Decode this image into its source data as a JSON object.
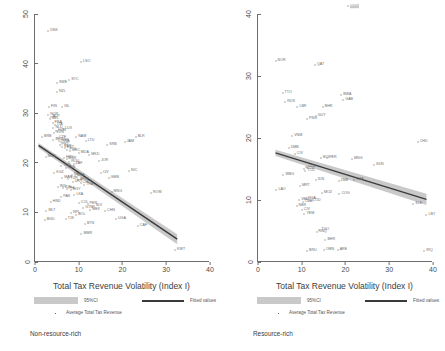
{
  "figure": {
    "type": "two-panel-scatter",
    "panels": [
      "non-resource-rich",
      "resource-rich"
    ]
  },
  "legend": {
    "ci_label": "95%CI",
    "fitted_label": "Fitted values",
    "average_label": "Average Total Tax Revenue",
    "ci_color": "#c9c9c9",
    "line_color": "#3a3a3a",
    "marker_color": "#6a6a6a"
  },
  "chart_data": [
    {
      "type": "scatter",
      "panel_id": "non-resource-rich",
      "title": "",
      "caption": "Non-resource-rich",
      "xlabel": "Total Tax Revenue Volatility (Index I)",
      "ylabel": "",
      "xlim": [
        0,
        40
      ],
      "ylim": [
        0,
        50
      ],
      "xticks": [
        0,
        10,
        20,
        30,
        40
      ],
      "yticks": [
        0,
        10,
        20,
        30,
        40,
        50
      ],
      "grid": false,
      "legend_position": "below-axis",
      "fit_line": {
        "x": [
          0.8,
          32.5
        ],
        "y": [
          23.5,
          4.6
        ],
        "ci_halfwidth": [
          0.5,
          1.0
        ]
      },
      "points": [
        {
          "label": "DNK",
          "x": 3.0,
          "y": 46.5
        },
        {
          "label": "LSO",
          "x": 10.5,
          "y": 40.4
        },
        {
          "label": "SWE",
          "x": 5.0,
          "y": 36.0
        },
        {
          "label": "SYC",
          "x": 7.8,
          "y": 36.6
        },
        {
          "label": "NZL",
          "x": 5.0,
          "y": 34.2
        },
        {
          "label": "FIN",
          "x": 3.2,
          "y": 31.2
        },
        {
          "label": "ISL",
          "x": 6.2,
          "y": 31.2
        },
        {
          "label": "NOR",
          "x": 3.0,
          "y": 29.6
        },
        {
          "label": "AUT",
          "x": 3.6,
          "y": 29.2
        },
        {
          "label": "BEL",
          "x": 3.4,
          "y": 28.8
        },
        {
          "label": "FRA",
          "x": 4.0,
          "y": 28.0
        },
        {
          "label": "ITA",
          "x": 4.6,
          "y": 27.6
        },
        {
          "label": "NLD",
          "x": 4.2,
          "y": 27.0
        },
        {
          "label": "LUX",
          "x": 6.4,
          "y": 26.8
        },
        {
          "label": "HUN",
          "x": 4.8,
          "y": 26.4
        },
        {
          "label": "SVN",
          "x": 4.4,
          "y": 26.0
        },
        {
          "label": "BRB",
          "x": 1.6,
          "y": 25.2
        },
        {
          "label": "NAM",
          "x": 9.4,
          "y": 25.2
        },
        {
          "label": "CZE",
          "x": 5.0,
          "y": 25.0
        },
        {
          "label": "DEU",
          "x": 4.2,
          "y": 24.6
        },
        {
          "label": "GBR",
          "x": 5.4,
          "y": 24.4
        },
        {
          "label": "LVA",
          "x": 6.0,
          "y": 24.2
        },
        {
          "label": "LTU",
          "x": 11.6,
          "y": 24.4
        },
        {
          "label": "BLR",
          "x": 23.0,
          "y": 25.2
        },
        {
          "label": "JAM",
          "x": 20.5,
          "y": 24.2
        },
        {
          "label": "SRB",
          "x": 16.5,
          "y": 23.6
        },
        {
          "label": "PRT",
          "x": 5.6,
          "y": 23.6
        },
        {
          "label": "ESP",
          "x": 6.2,
          "y": 23.2
        },
        {
          "label": "EST",
          "x": 6.8,
          "y": 23.0
        },
        {
          "label": "POL",
          "x": 7.4,
          "y": 22.6
        },
        {
          "label": "GRC",
          "x": 8.0,
          "y": 22.4
        },
        {
          "label": "MDA",
          "x": 10.0,
          "y": 22.0
        },
        {
          "label": "MKD",
          "x": 12.4,
          "y": 21.6
        },
        {
          "label": "MUS",
          "x": 2.4,
          "y": 21.2
        },
        {
          "label": "HRV",
          "x": 6.6,
          "y": 21.0
        },
        {
          "label": "BGR",
          "x": 7.2,
          "y": 20.8
        },
        {
          "label": "JOR",
          "x": 14.6,
          "y": 20.4
        },
        {
          "label": "ROU",
          "x": 7.8,
          "y": 20.2
        },
        {
          "label": "ZAF",
          "x": 8.8,
          "y": 19.8
        },
        {
          "label": "TUN",
          "x": 6.0,
          "y": 19.4
        },
        {
          "label": "KEN",
          "x": 7.0,
          "y": 19.0
        },
        {
          "label": "NIC",
          "x": 21.5,
          "y": 18.4
        },
        {
          "label": "CIV",
          "x": 15.0,
          "y": 18.0
        },
        {
          "label": "KGZ",
          "x": 4.4,
          "y": 18.0
        },
        {
          "label": "SEN",
          "x": 8.4,
          "y": 17.6
        },
        {
          "label": "BRA",
          "x": 9.2,
          "y": 17.4
        },
        {
          "label": "GMB",
          "x": 16.8,
          "y": 17.0
        },
        {
          "label": "MAR",
          "x": 6.2,
          "y": 17.0
        },
        {
          "label": "TUR",
          "x": 7.6,
          "y": 16.8
        },
        {
          "label": "ARG",
          "x": 9.8,
          "y": 16.6
        },
        {
          "label": "URY",
          "x": 8.6,
          "y": 16.2
        },
        {
          "label": "CHL",
          "x": 10.4,
          "y": 16.0
        },
        {
          "label": "THA",
          "x": 11.2,
          "y": 15.6
        },
        {
          "label": "IND",
          "x": 5.2,
          "y": 15.2
        },
        {
          "label": "IDN",
          "x": 6.4,
          "y": 15.0
        },
        {
          "label": "PHL",
          "x": 7.2,
          "y": 14.8
        },
        {
          "label": "EGY",
          "x": 8.2,
          "y": 14.6
        },
        {
          "label": "MNG",
          "x": 17.5,
          "y": 14.2
        },
        {
          "label": "ROM",
          "x": 26.5,
          "y": 14.0
        },
        {
          "label": "LKA",
          "x": 9.0,
          "y": 13.6
        },
        {
          "label": "PAK",
          "x": 6.0,
          "y": 13.2
        },
        {
          "label": "HND",
          "x": 3.6,
          "y": 12.0
        },
        {
          "label": "COL",
          "x": 10.0,
          "y": 11.8
        },
        {
          "label": "PER",
          "x": 12.0,
          "y": 11.6
        },
        {
          "label": "SLV",
          "x": 13.4,
          "y": 11.2
        },
        {
          "label": "GTM",
          "x": 11.0,
          "y": 10.8
        },
        {
          "label": "MEX",
          "x": 12.6,
          "y": 10.4
        },
        {
          "label": "CHN",
          "x": 16.0,
          "y": 10.2
        },
        {
          "label": "MLT",
          "x": 2.6,
          "y": 10.2
        },
        {
          "label": "NPL",
          "x": 8.2,
          "y": 9.8
        },
        {
          "label": "BOL",
          "x": 9.4,
          "y": 9.4
        },
        {
          "label": "UGA",
          "x": 18.5,
          "y": 8.6
        },
        {
          "label": "BGD",
          "x": 2.2,
          "y": 8.4
        },
        {
          "label": "TJK",
          "x": 7.0,
          "y": 8.6
        },
        {
          "label": "BTN",
          "x": 11.4,
          "y": 7.6
        },
        {
          "label": "CAF",
          "x": 23.5,
          "y": 7.2
        },
        {
          "label": "MMR",
          "x": 10.6,
          "y": 5.6
        },
        {
          "label": "KWT",
          "x": 32.0,
          "y": 2.4
        }
      ]
    },
    {
      "type": "scatter",
      "panel_id": "resource-rich",
      "title": "",
      "caption": "Resource-rich",
      "xlabel": "Total Tax Revenue Volatility (Index I)",
      "ylabel": "",
      "xlim": [
        0,
        40
      ],
      "ylim": [
        0,
        40
      ],
      "xticks": [
        0,
        10,
        20,
        30,
        40
      ],
      "yticks": [
        0,
        10,
        20,
        30,
        40
      ],
      "grid": false,
      "legend_position": "below-axis",
      "highlighted_point": "AGO",
      "fit_line": {
        "x": [
          4.0,
          38.5
        ],
        "y": [
          17.6,
          10.1
        ],
        "ci_halfwidth": [
          0.5,
          0.9
        ]
      },
      "points": [
        {
          "label": "AGO",
          "x": 20.5,
          "y": 41.3,
          "highlight": true
        },
        {
          "label": "NOR",
          "x": 4.0,
          "y": 32.4
        },
        {
          "label": "QAT",
          "x": 13.0,
          "y": 31.8
        },
        {
          "label": "TTO",
          "x": 5.6,
          "y": 27.2
        },
        {
          "label": "BWA",
          "x": 19.0,
          "y": 27.0
        },
        {
          "label": "RUS",
          "x": 6.2,
          "y": 25.8
        },
        {
          "label": "GAB",
          "x": 19.5,
          "y": 26.2
        },
        {
          "label": "LBR",
          "x": 9.0,
          "y": 25.0
        },
        {
          "label": "BHR",
          "x": 14.8,
          "y": 25.0
        },
        {
          "label": "GUY",
          "x": 13.2,
          "y": 23.6
        },
        {
          "label": "PNG",
          "x": 11.2,
          "y": 23.0
        },
        {
          "label": "VNM",
          "x": 7.8,
          "y": 20.4
        },
        {
          "label": "CHD",
          "x": 36.5,
          "y": 19.4
        },
        {
          "label": "DMB",
          "x": 7.0,
          "y": 18.4
        },
        {
          "label": "CIV",
          "x": 8.4,
          "y": 17.4
        },
        {
          "label": "MNG",
          "x": 21.5,
          "y": 16.6
        },
        {
          "label": "PER",
          "x": 15.8,
          "y": 16.8
        },
        {
          "label": "BOL",
          "x": 14.4,
          "y": 16.8
        },
        {
          "label": "SDN",
          "x": 26.5,
          "y": 15.6
        },
        {
          "label": "COL",
          "x": 11.0,
          "y": 15.4
        },
        {
          "label": "ECU",
          "x": 10.6,
          "y": 15.0
        },
        {
          "label": "TCD",
          "x": 10.8,
          "y": 14.6
        },
        {
          "label": "WBG",
          "x": 5.8,
          "y": 14.0
        },
        {
          "label": "IDN",
          "x": 13.2,
          "y": 13.2
        },
        {
          "label": "ZMB",
          "x": 18.4,
          "y": 13.0
        },
        {
          "label": "DZA",
          "x": 22.0,
          "y": 13.2
        },
        {
          "label": "MRT",
          "x": 9.6,
          "y": 12.2
        },
        {
          "label": "LAO",
          "x": 4.2,
          "y": 11.6
        },
        {
          "label": "MOZ",
          "x": 14.6,
          "y": 11.2
        },
        {
          "label": "COG",
          "x": 18.6,
          "y": 11.0
        },
        {
          "label": "NGA",
          "x": 11.0,
          "y": 10.2
        },
        {
          "label": "VEN",
          "x": 9.4,
          "y": 10.0
        },
        {
          "label": "CMR",
          "x": 10.2,
          "y": 9.6
        },
        {
          "label": "COD",
          "x": 12.0,
          "y": 9.8
        },
        {
          "label": "NER",
          "x": 8.8,
          "y": 9.0
        },
        {
          "label": "CIV2",
          "x": 10.0,
          "y": 8.4
        },
        {
          "label": "SLE",
          "x": 35.5,
          "y": 9.4
        },
        {
          "label": "YEM",
          "x": 10.6,
          "y": 7.8
        },
        {
          "label": "LBY",
          "x": 38.5,
          "y": 7.6
        },
        {
          "label": "TGO",
          "x": 14.0,
          "y": 5.2
        },
        {
          "label": "GNQ",
          "x": 13.4,
          "y": 4.8
        },
        {
          "label": "BHR2",
          "x": 15.4,
          "y": 3.6
        },
        {
          "label": "BRU",
          "x": 11.2,
          "y": 1.8
        },
        {
          "label": "OMN",
          "x": 15.0,
          "y": 2.0
        },
        {
          "label": "ARE",
          "x": 18.2,
          "y": 2.0
        },
        {
          "label": "IRQ",
          "x": 38.0,
          "y": 1.8
        }
      ]
    }
  ]
}
